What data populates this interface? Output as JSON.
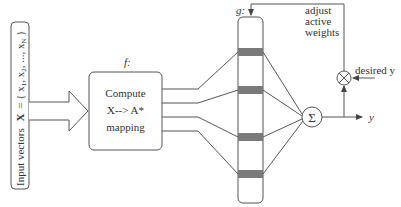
{
  "input": {
    "label": "Input vectors",
    "vector_symbol": "X",
    "vector_expr": "= { x",
    "vector_tail": ", ..., x",
    "sub1": "1",
    "sub2": "2",
    "subN": "N",
    "x2": ", x",
    "close": " }"
  },
  "mapping": {
    "f_label": "f:",
    "line1": "Compute",
    "line2": "X--> A*",
    "line3": "mapping"
  },
  "weights": {
    "g_label": "g:",
    "band_count": 4,
    "band_color": "#777777"
  },
  "feedback": {
    "line1": "adjust",
    "line2": "active",
    "line3": "weights",
    "desired": "desired y",
    "output": "y",
    "sum_symbol": "Σ"
  }
}
